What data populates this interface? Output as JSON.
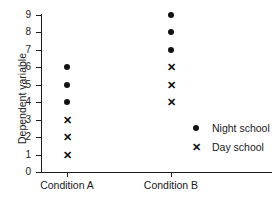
{
  "chart_data": {
    "type": "scatter",
    "title": "",
    "xlabel": "",
    "ylabel": "Dependent variable",
    "categories": [
      "Condition A",
      "Condition B"
    ],
    "ylim": [
      0,
      9
    ],
    "ytick_labels": [
      "0",
      "1",
      "2",
      "3",
      "4",
      "5",
      "6",
      "7",
      "8",
      "9"
    ],
    "ytick_values": [
      0,
      1,
      2,
      3,
      4,
      5,
      6,
      7,
      8,
      9
    ],
    "grid": false,
    "legend_position": "right-inside",
    "series": [
      {
        "name": "Night school",
        "marker": "filled-circle",
        "color": "#111111",
        "points": [
          {
            "category": "Condition A",
            "value": 6
          },
          {
            "category": "Condition A",
            "value": 5
          },
          {
            "category": "Condition A",
            "value": 4
          },
          {
            "category": "Condition B",
            "value": 9
          },
          {
            "category": "Condition B",
            "value": 8
          },
          {
            "category": "Condition B",
            "value": 7
          }
        ]
      },
      {
        "name": "Day school",
        "marker": "cross",
        "color": "#111111",
        "points": [
          {
            "category": "Condition A",
            "value": 3
          },
          {
            "category": "Condition A",
            "value": 2
          },
          {
            "category": "Condition A",
            "value": 1
          },
          {
            "category": "Condition B",
            "value": 6
          },
          {
            "category": "Condition B",
            "value": 5
          },
          {
            "category": "Condition B",
            "value": 4
          }
        ]
      }
    ]
  },
  "legend": {
    "entries": [
      {
        "label": "Night school",
        "glyph": "●",
        "marker": "filled-circle"
      },
      {
        "label": "Day school",
        "glyph": "✕",
        "marker": "cross"
      }
    ]
  },
  "glyphs": {
    "cross": "✕"
  }
}
